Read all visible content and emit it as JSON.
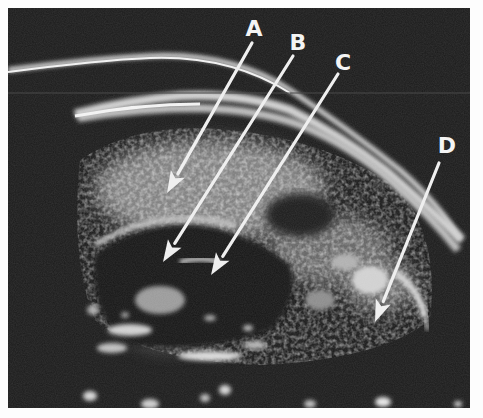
{
  "image": {
    "description": "Grayscale ultrasound B-scan with four labeled arrows",
    "colors": {
      "background_border": "#fdfdfd",
      "scan_field": "#1b1b1b",
      "echo_bright": "#e6e6e6",
      "arrow": "#efefef"
    }
  },
  "annotations": [
    {
      "id": "A",
      "label": "A",
      "label_x": 254,
      "label_y": 36,
      "tail": [
        252,
        43
      ],
      "tip": [
        167,
        193
      ]
    },
    {
      "id": "B",
      "label": "B",
      "label_x": 298,
      "label_y": 50,
      "tail": [
        293,
        56
      ],
      "tip": [
        163,
        262
      ]
    },
    {
      "id": "C",
      "label": "C",
      "label_x": 343,
      "label_y": 70,
      "tail": [
        338,
        74
      ],
      "tip": [
        211,
        275
      ]
    },
    {
      "id": "D",
      "label": "D",
      "label_x": 447,
      "label_y": 153,
      "tail": [
        439,
        163
      ],
      "tip": [
        375,
        322
      ]
    }
  ]
}
